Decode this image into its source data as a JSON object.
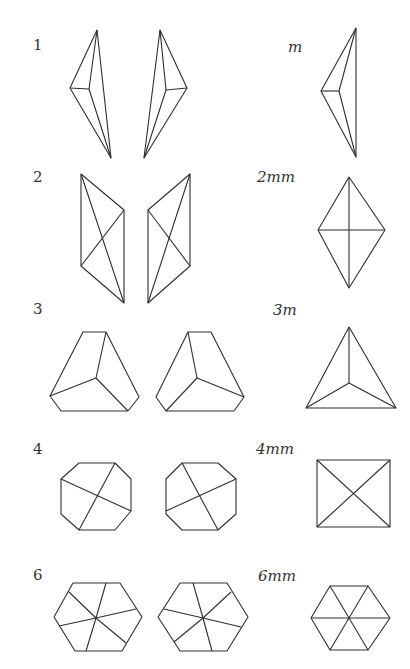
{
  "rows": [
    {
      "left_label": "1",
      "right_label": "m"
    },
    {
      "left_label": "2",
      "right_label": "2mm"
    },
    {
      "left_label": "3",
      "right_label": "3m"
    },
    {
      "left_label": "4",
      "right_label": "4mm"
    },
    {
      "left_label": "6",
      "right_label": "6mm"
    }
  ],
  "colors": {
    "stroke": "#2f2f2f",
    "background": "#ffffff",
    "text": "#333333"
  }
}
